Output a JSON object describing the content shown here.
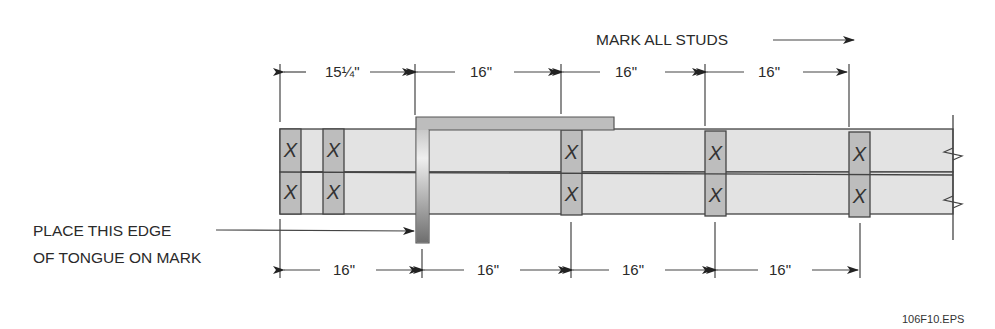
{
  "figure": {
    "title_note": "MARK ALL STUDS",
    "callout": [
      "PLACE THIS EDGE",
      "OF TONGUE ON MARK"
    ],
    "figure_id": "106F10.EPS"
  },
  "top_dimensions": [
    {
      "label": "15¼\"",
      "x1": 280,
      "x2": 415
    },
    {
      "label": "16\"",
      "x1": 415,
      "x2": 561
    },
    {
      "label": "16\"",
      "x1": 561,
      "x2": 705
    },
    {
      "label": "16\"",
      "x1": 705,
      "x2": 849
    }
  ],
  "bottom_dimensions": [
    {
      "label": "16\"",
      "x1": 280,
      "x2": 422
    },
    {
      "label": "16\"",
      "x1": 422,
      "x2": 571
    },
    {
      "label": "16\"",
      "x1": 571,
      "x2": 715
    },
    {
      "label": "16\"",
      "x1": 715,
      "x2": 860
    }
  ],
  "studs": [
    {
      "x": 280,
      "mark": "X"
    },
    {
      "x": 323,
      "mark": "X"
    },
    {
      "x": 561,
      "mark": "X"
    },
    {
      "x": 705,
      "mark": "X"
    },
    {
      "x": 849,
      "mark": "X"
    }
  ],
  "colors": {
    "plate": "#e3e3e3",
    "stud": "#bdbdbd",
    "square": "#b8b8b8",
    "line": "#444444"
  }
}
